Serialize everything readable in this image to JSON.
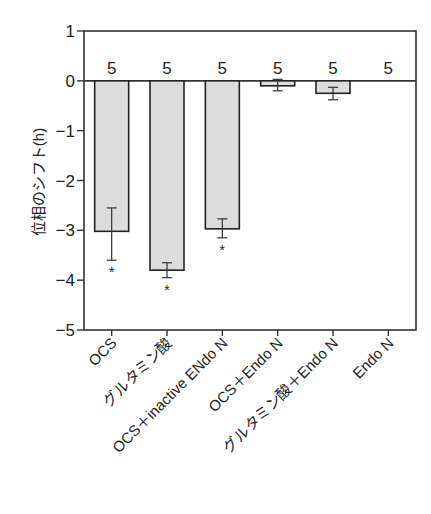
{
  "chart_data": {
    "type": "bar",
    "title": "",
    "xlabel": "",
    "ylabel": "位相のシフト(h)",
    "ylim": [
      -5,
      1
    ],
    "yticks": [
      1,
      0,
      -1,
      -2,
      -3,
      -4,
      -5
    ],
    "ytick_labels": [
      "1",
      "0",
      "−1",
      "−2",
      "−3",
      "−4",
      "−5"
    ],
    "grid": false,
    "legend": null,
    "categories": [
      "OCS",
      "グルタミン酸",
      "OCS＋inactive ENdo N",
      "OCS＋Endo N",
      "グルタミン酸＋Endo N",
      "Endo N"
    ],
    "values": [
      -3.02,
      -3.8,
      -2.97,
      -0.1,
      -0.25,
      0.0
    ],
    "error_upper": [
      -2.55,
      -3.65,
      -2.77,
      0.03,
      -0.13,
      0.0
    ],
    "error_lower": [
      -3.6,
      -3.95,
      -3.15,
      -0.2,
      -0.38,
      0.0
    ],
    "n_labels": [
      "5",
      "5",
      "5",
      "5",
      "5",
      "5"
    ],
    "significance": [
      "*",
      "*",
      "*",
      "",
      "",
      ""
    ],
    "bar_fill": "#dcdcdc",
    "bar_stroke": "#222222"
  }
}
